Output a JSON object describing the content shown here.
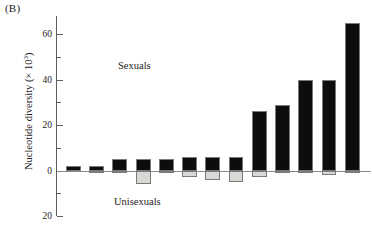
{
  "panel": {
    "label": "(B)"
  },
  "axis": {
    "ylabel_text": "Nucleotide diversity (× 10",
    "ylabel_exp": "3",
    "ylabel_close": ")",
    "ticks": [
      {
        "value": 60,
        "label": "60",
        "major": true
      },
      {
        "value": 50,
        "label": "",
        "major": false
      },
      {
        "value": 40,
        "label": "40",
        "major": true
      },
      {
        "value": 30,
        "label": "",
        "major": false
      },
      {
        "value": 20,
        "label": "20",
        "major": true
      },
      {
        "value": 10,
        "label": "",
        "major": false
      },
      {
        "value": 0,
        "label": "0",
        "major": true
      },
      {
        "value": -10,
        "label": "",
        "major": false
      },
      {
        "value": -20,
        "label": "20",
        "major": true
      }
    ]
  },
  "annotations": {
    "sexuals": "Sexuals",
    "unisexuals": "Unisexuals"
  },
  "colors": {
    "positive_bar": "#0d0d0d",
    "negative_bar": "#d8d8d4",
    "bar_outline": "#7a7a7a",
    "axis": "#5d5d5d",
    "background": "#ffffff"
  },
  "chart_data": {
    "type": "bar",
    "title": "(B)",
    "xlabel": "",
    "ylabel": "Nucleotide diversity (× 10³)",
    "ylim": [
      -20,
      68
    ],
    "yticks": [
      -20,
      -10,
      0,
      10,
      20,
      30,
      40,
      50,
      60
    ],
    "ytick_labels": [
      "20",
      "",
      "0",
      "",
      "20",
      "",
      "40",
      "",
      "60"
    ],
    "grid": false,
    "legend": "none",
    "orientation": "diverging",
    "categories": [
      "1",
      "2",
      "3",
      "4",
      "5",
      "6",
      "7",
      "8",
      "9",
      "10",
      "11",
      "12",
      "13"
    ],
    "series": [
      {
        "name": "Sexuals",
        "color": "#0d0d0d",
        "values": [
          2,
          2,
          5,
          5,
          5,
          6,
          6,
          6,
          26,
          29,
          40,
          40,
          65
        ]
      },
      {
        "name": "Unisexuals",
        "color": "#d8d8d4",
        "values": [
          0,
          -1,
          -1,
          -6,
          -1,
          -3,
          -4,
          -5,
          -3,
          -1,
          -1,
          -2,
          -1
        ]
      }
    ]
  }
}
